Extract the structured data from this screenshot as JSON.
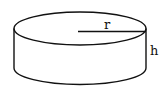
{
  "figure": {
    "shape": "cylinder",
    "labels": {
      "radius": "r",
      "height": "h"
    },
    "colors": {
      "stroke": "#111111",
      "background": "#ffffff"
    }
  }
}
